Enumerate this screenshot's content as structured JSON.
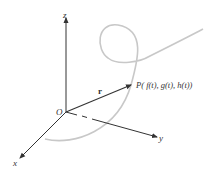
{
  "diagram": {
    "axes": {
      "z_label": "z",
      "x_label": "x",
      "y_label": "y",
      "origin_label": "O"
    },
    "vector_label": "r",
    "point_label": "P( f(t), g(t), h(t))",
    "colors": {
      "axis": "#333333",
      "curve": "#c8c8c8",
      "text": "#333333"
    }
  }
}
